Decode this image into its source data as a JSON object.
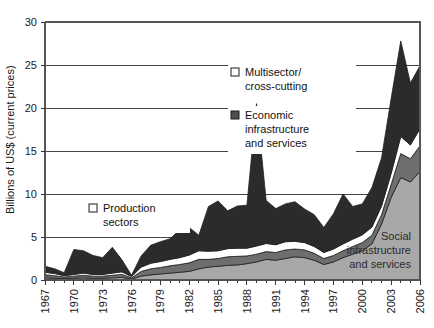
{
  "chart_data": {
    "type": "area",
    "title": "",
    "xlabel": "",
    "ylabel": "Billions of US$ (current prices)",
    "ylim": [
      0,
      30
    ],
    "yticks": [
      0,
      5,
      10,
      15,
      20,
      25,
      30
    ],
    "ytick_labels": [
      "0",
      "5",
      "10",
      "15",
      "20",
      "25",
      "30"
    ],
    "grid": "horizontal",
    "stacked": true,
    "legend_position": "inside-plot",
    "x": [
      1967,
      1968,
      1969,
      1970,
      1971,
      1972,
      1973,
      1974,
      1975,
      1976,
      1977,
      1978,
      1979,
      1980,
      1981,
      1982,
      1983,
      1984,
      1985,
      1986,
      1987,
      1988,
      1989,
      1990,
      1991,
      1992,
      1993,
      1994,
      1995,
      1996,
      1997,
      1998,
      1999,
      2000,
      2001,
      2002,
      2003,
      2004,
      2005,
      2006
    ],
    "xtick_labels": [
      "1967",
      "1970",
      "1973",
      "1976",
      "1979",
      "1982",
      "1985",
      "1988",
      "1991",
      "1994",
      "1997",
      "2000",
      "2003",
      "2006"
    ],
    "xticks": [
      1967,
      1970,
      1973,
      1976,
      1979,
      1982,
      1985,
      1988,
      1991,
      1994,
      1997,
      2000,
      2003,
      2006
    ],
    "series": [
      {
        "name": "Social infrastructure and services",
        "color": "#a8a8a8",
        "values": [
          0.25,
          0.2,
          0.15,
          0.2,
          0.25,
          0.2,
          0.2,
          0.25,
          0.3,
          0.1,
          0.45,
          0.6,
          0.7,
          0.8,
          0.9,
          1.0,
          1.3,
          1.5,
          1.6,
          1.7,
          1.75,
          1.9,
          2.1,
          2.4,
          2.3,
          2.5,
          2.7,
          2.6,
          2.3,
          1.8,
          2.1,
          2.6,
          3.0,
          3.4,
          4.2,
          6.5,
          9.6,
          11.9,
          11.4,
          12.6
        ]
      },
      {
        "name": "Production sectors",
        "color": "#6e6e6e",
        "values": [
          0.35,
          0.3,
          0.2,
          0.25,
          0.3,
          0.25,
          0.25,
          0.3,
          0.35,
          0.15,
          0.55,
          0.7,
          0.75,
          0.85,
          0.9,
          1.0,
          1.1,
          0.9,
          0.9,
          1.0,
          1.0,
          0.9,
          0.9,
          0.9,
          0.9,
          1.0,
          0.9,
          0.9,
          0.8,
          0.7,
          0.75,
          0.8,
          0.9,
          0.95,
          1.0,
          1.1,
          1.5,
          2.8,
          2.7,
          3.0
        ]
      },
      {
        "name": "Multisector/cross-cutting",
        "color": "#ffffff",
        "values": [
          0.3,
          0.25,
          0.15,
          0.2,
          0.25,
          0.2,
          0.2,
          0.25,
          0.3,
          0.15,
          0.5,
          0.65,
          0.7,
          0.75,
          0.8,
          0.9,
          1.0,
          0.95,
          0.9,
          0.95,
          0.95,
          0.9,
          0.95,
          0.95,
          0.9,
          0.95,
          0.9,
          0.85,
          0.8,
          0.7,
          0.75,
          0.8,
          0.85,
          0.9,
          0.95,
          1.0,
          1.3,
          2.0,
          1.6,
          2.0
        ]
      },
      {
        "name": "Economic infrastructure and services",
        "color": "#2b2b2b",
        "values": [
          0.7,
          0.55,
          0.35,
          2.9,
          2.6,
          2.2,
          1.95,
          3.0,
          1.4,
          0.15,
          1.3,
          2.1,
          2.3,
          2.4,
          3.2,
          3.2,
          1.8,
          5.2,
          5.8,
          4.4,
          4.9,
          5.0,
          16.55,
          5.0,
          4.2,
          4.4,
          4.6,
          3.9,
          3.7,
          2.9,
          4.1,
          5.8,
          3.8,
          3.6,
          4.6,
          5.6,
          8.7,
          11.1,
          7.2,
          7.3
        ]
      }
    ],
    "totals_note": "Stacked totals peak at about 27.8 in 2004, with a spike to about 20.5 in 1989."
  },
  "legend": {
    "entries": [
      {
        "label_line1": "Multisector/",
        "label_line2": "cross-cutting",
        "swatch": "white",
        "swatch_color": "#ffffff"
      },
      {
        "label_line1": "Economic",
        "label_line2": "infrastructure",
        "label_line3": "and services",
        "swatch": "dark",
        "swatch_color": "#4d4d4d"
      },
      {
        "label_line1": "Production",
        "label_line2": "sectors",
        "swatch": "white",
        "swatch_color": "#ffffff"
      }
    ]
  },
  "inline_labels": [
    {
      "line1": "Social",
      "line2": "infrastructure",
      "line3": "and services"
    }
  ],
  "axes": {
    "y_axis_title": "Billions of US$ (current prices)"
  }
}
